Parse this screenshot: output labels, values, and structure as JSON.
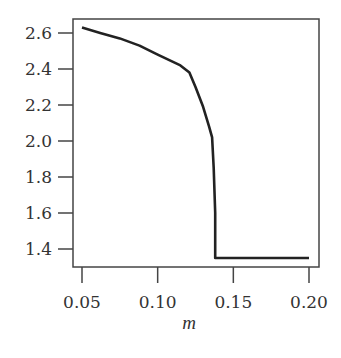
{
  "chart_data": {
    "type": "line",
    "title": "",
    "xlabel": "m",
    "ylabel": "",
    "xlim": [
      0.05,
      0.2
    ],
    "ylim": [
      1.35,
      2.63
    ],
    "grid": false,
    "legend": null,
    "x_ticks": [
      "0.05",
      "0.10",
      "0.15",
      "0.20"
    ],
    "y_ticks": [
      "2.6",
      "2.4",
      "2.2",
      "2.0",
      "1.8",
      "1.6",
      "1.4"
    ],
    "series": [
      {
        "name": "curve",
        "x": [
          0.05,
          0.062,
          0.075,
          0.088,
          0.1,
          0.115,
          0.121,
          0.125,
          0.13,
          0.134,
          0.136,
          0.137,
          0.138,
          0.138,
          0.14,
          0.16,
          0.18,
          0.2
        ],
        "y": [
          2.63,
          2.6,
          2.57,
          2.53,
          2.48,
          2.42,
          2.38,
          2.3,
          2.19,
          2.08,
          2.02,
          1.85,
          1.6,
          1.35,
          1.35,
          1.35,
          1.35,
          1.35
        ]
      }
    ],
    "line_color": "#222222"
  }
}
